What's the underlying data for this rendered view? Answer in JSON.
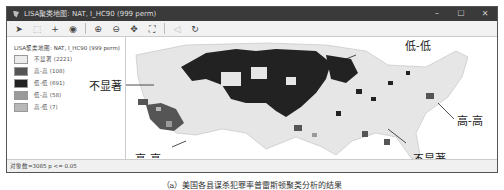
{
  "window": {
    "title": "LISA聚类地图: NAT, I_HC90 (999 perm)",
    "controls": [
      "–",
      "☐",
      "✕"
    ]
  },
  "toolbar": {
    "icons": [
      {
        "name": "select-arrow-icon",
        "glyph": "➤"
      },
      {
        "name": "select-region-icon",
        "glyph": "⬚"
      },
      {
        "name": "crosshair-icon",
        "glyph": "+"
      },
      {
        "name": "layers-icon",
        "glyph": "◉"
      },
      {
        "name": "zoom-in-icon",
        "glyph": "⊕"
      },
      {
        "name": "zoom-out-icon",
        "glyph": "⊖"
      },
      {
        "name": "pan-icon",
        "glyph": "✥"
      },
      {
        "name": "fit-extent-icon",
        "glyph": "⛶"
      },
      {
        "name": "back-icon",
        "glyph": "◁"
      },
      {
        "name": "refresh-icon",
        "glyph": "↻"
      }
    ]
  },
  "legend": {
    "title": "LISA聚类地图: NAT, I_HC90 (999 perm)",
    "items": [
      {
        "label": "不显著 (2221)",
        "color": "#ececec"
      },
      {
        "label": "高-高 (108)",
        "color": "#555555"
      },
      {
        "label": "低-低 (691)",
        "color": "#222222"
      },
      {
        "label": "低-高 (58)",
        "color": "#9a9a9a"
      },
      {
        "label": "高-低 (7)",
        "color": "#b8b8b8"
      }
    ]
  },
  "annotations": {
    "low_low": "低-低",
    "not_sig_left": "不显著",
    "high_high_left": "高-高",
    "high_high_right": "高-高",
    "not_sig_right": "不显著"
  },
  "statusbar": {
    "text": "对象数=3085  p <= 0.05"
  },
  "caption": "（a）美国各县谋杀犯罪率普雷斯顿聚类分析的结果"
}
